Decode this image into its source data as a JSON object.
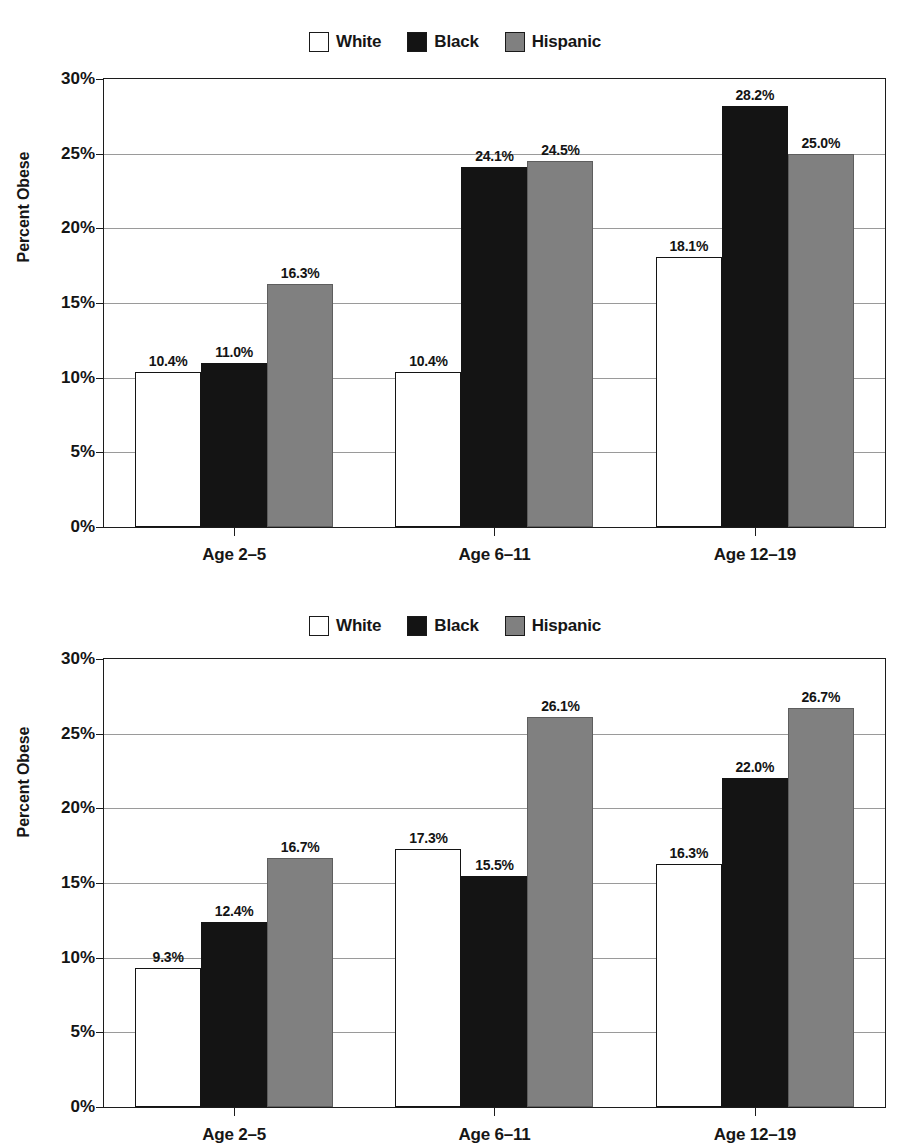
{
  "chart_data": [
    {
      "id": "chart-1",
      "type": "bar",
      "title": "",
      "xlabel": "",
      "ylabel": "Percent Obese",
      "ylim": [
        0,
        30
      ],
      "ytick_labels": [
        "0%",
        "5%",
        "10%",
        "15%",
        "20%",
        "25%",
        "30%"
      ],
      "yticks": [
        0,
        5,
        10,
        15,
        20,
        25,
        30
      ],
      "grid": true,
      "legend_position": "top-center",
      "categories": [
        "Age 2–5",
        "Age 6–11",
        "Age 12–19"
      ],
      "series": [
        {
          "name": "White",
          "color": "#ffffff",
          "values": [
            10.4,
            10.4,
            18.1
          ],
          "labels": [
            "10.4%",
            "10.4%",
            "18.1%"
          ]
        },
        {
          "name": "Black",
          "color": "#141414",
          "values": [
            11.0,
            24.1,
            28.2
          ],
          "labels": [
            "11.0%",
            "24.1%",
            "28.2%"
          ]
        },
        {
          "name": "Hispanic",
          "color": "#808080",
          "values": [
            16.3,
            24.5,
            25.0
          ],
          "labels": [
            "16.3%",
            "24.5%",
            "25.0%"
          ]
        }
      ]
    },
    {
      "id": "chart-2",
      "type": "bar",
      "title": "",
      "xlabel": "",
      "ylabel": "Percent Obese",
      "ylim": [
        0,
        30
      ],
      "ytick_labels": [
        "0%",
        "5%",
        "10%",
        "15%",
        "20%",
        "25%",
        "30%"
      ],
      "yticks": [
        0,
        5,
        10,
        15,
        20,
        25,
        30
      ],
      "grid": true,
      "legend_position": "top-center",
      "categories": [
        "Age 2–5",
        "Age 6–11",
        "Age 12–19"
      ],
      "series": [
        {
          "name": "White",
          "color": "#ffffff",
          "values": [
            9.3,
            17.3,
            16.3
          ],
          "labels": [
            "9.3%",
            "17.3%",
            "16.3%"
          ]
        },
        {
          "name": "Black",
          "color": "#141414",
          "values": [
            12.4,
            15.5,
            22.0
          ],
          "labels": [
            "12.4%",
            "15.5%",
            "22.0%"
          ]
        },
        {
          "name": "Hispanic",
          "color": "#808080",
          "values": [
            16.7,
            26.1,
            26.7
          ],
          "labels": [
            "16.7%",
            "26.1%",
            "26.7%"
          ]
        }
      ]
    }
  ],
  "charts": [
    {
      "legend": [
        {
          "label": "White",
          "swatch": "white-swatch"
        },
        {
          "label": "Black",
          "swatch": "black-swatch"
        },
        {
          "label": "Hispanic",
          "swatch": "hispanic-swatch"
        }
      ],
      "axis_title": "Percent Obese"
    },
    {
      "legend": [
        {
          "label": "White",
          "swatch": "white-swatch"
        },
        {
          "label": "Black",
          "swatch": "black-swatch"
        },
        {
          "label": "Hispanic",
          "swatch": "hispanic-swatch"
        }
      ],
      "axis_title": "Percent Obese"
    }
  ]
}
